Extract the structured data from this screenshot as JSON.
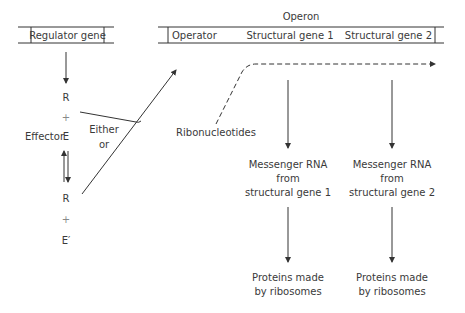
{
  "diagram": {
    "regulator": {
      "label": "Regulator gene"
    },
    "operon": {
      "title": "Operon",
      "segments": [
        "Operator",
        "Structural gene 1",
        "Structural gene 2"
      ]
    },
    "left_column": {
      "R1": "R",
      "plus1": "+",
      "E": "E",
      "effector_label": "Effector",
      "R2": "R",
      "plus2": "+",
      "E_prime": "E′"
    },
    "either_or": {
      "line1": "Either",
      "line2": "or"
    },
    "ribonucleotides": "Ribonucleotides",
    "mrna": [
      {
        "line1": "Messenger RNA",
        "line2": "from",
        "line3": "structural gene 1"
      },
      {
        "line1": "Messenger RNA",
        "line2": "from",
        "line3": "structural gene 2"
      }
    ],
    "proteins": [
      {
        "line1": "Proteins made",
        "line2": "by ribosomes"
      },
      {
        "line1": "Proteins made",
        "line2": "by ribosomes"
      }
    ]
  }
}
